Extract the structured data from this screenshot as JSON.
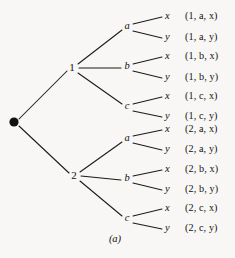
{
  "figure": {
    "caption": "(a)",
    "background_color": "#f8f7f5",
    "ink_color": "#111111",
    "type": "probability-tree-diagram"
  },
  "tree": {
    "root": {
      "name": "root-node",
      "label": "",
      "shape": "filled-dot",
      "x": 14,
      "y": 122
    },
    "level1": [
      {
        "name": "node-1",
        "label": "1",
        "x": 72,
        "y": 68
      },
      {
        "name": "node-2",
        "label": "2",
        "x": 74,
        "y": 176
      }
    ],
    "level2": [
      {
        "name": "node-1-a",
        "label": "a",
        "parent": "1",
        "x": 127,
        "y": 27
      },
      {
        "name": "node-1-b",
        "label": "b",
        "parent": "1",
        "x": 127,
        "y": 67
      },
      {
        "name": "node-1-c",
        "label": "c",
        "parent": "1",
        "x": 127,
        "y": 107
      },
      {
        "name": "node-2-a",
        "label": "a",
        "parent": "2",
        "x": 127,
        "y": 139
      },
      {
        "name": "node-2-b",
        "label": "b",
        "parent": "2",
        "x": 127,
        "y": 179
      },
      {
        "name": "node-2-c",
        "label": "c",
        "parent": "2",
        "x": 127,
        "y": 219
      }
    ],
    "leaves": [
      {
        "name": "leaf-1-a-x",
        "label": "x",
        "x": 166,
        "y": 17
      },
      {
        "name": "leaf-1-a-y",
        "label": "y",
        "x": 166,
        "y": 38
      },
      {
        "name": "leaf-1-b-x",
        "label": "x",
        "x": 166,
        "y": 58
      },
      {
        "name": "leaf-1-b-y",
        "label": "y",
        "x": 166,
        "y": 78
      },
      {
        "name": "leaf-1-c-x",
        "label": "x",
        "x": 166,
        "y": 97
      },
      {
        "name": "leaf-1-c-y",
        "label": "y",
        "x": 166,
        "y": 117
      },
      {
        "name": "leaf-2-a-x",
        "label": "x",
        "x": 166,
        "y": 131
      },
      {
        "name": "leaf-2-a-y",
        "label": "y",
        "x": 166,
        "y": 150
      },
      {
        "name": "leaf-2-b-x",
        "label": "x",
        "x": 166,
        "y": 170
      },
      {
        "name": "leaf-2-b-y",
        "label": "y",
        "x": 166,
        "y": 190
      },
      {
        "name": "leaf-2-c-x",
        "label": "x",
        "x": 166,
        "y": 209
      },
      {
        "name": "leaf-2-c-y",
        "label": "y",
        "x": 166,
        "y": 229
      }
    ],
    "outcomes": [
      {
        "name": "outcome-1-a-x",
        "text": "(1, a, x)",
        "first": "1",
        "second": "a",
        "third": "x",
        "y": 17
      },
      {
        "name": "outcome-1-a-y",
        "text": "(1, a, y)",
        "first": "1",
        "second": "a",
        "third": "y",
        "y": 38
      },
      {
        "name": "outcome-1-b-x",
        "text": "(1, b, x)",
        "first": "1",
        "second": "b",
        "third": "x",
        "y": 58
      },
      {
        "name": "outcome-1-b-y",
        "text": "(1, b, y)",
        "first": "1",
        "second": "b",
        "third": "y",
        "y": 78
      },
      {
        "name": "outcome-1-c-x",
        "text": "(1, c, x)",
        "first": "1",
        "second": "c",
        "third": "x",
        "y": 97
      },
      {
        "name": "outcome-1-c-y",
        "text": "(1, c, y)",
        "first": "1",
        "second": "c",
        "third": "y",
        "y": 117
      },
      {
        "name": "outcome-2-a-x",
        "text": "(2, a, x)",
        "first": "2",
        "second": "a",
        "third": "x",
        "y": 131
      },
      {
        "name": "outcome-2-a-y",
        "text": "(2, a, y)",
        "first": "2",
        "second": "a",
        "third": "y",
        "y": 150
      },
      {
        "name": "outcome-2-b-x",
        "text": "(2, b, x)",
        "first": "2",
        "second": "b",
        "third": "x",
        "y": 170
      },
      {
        "name": "outcome-2-b-y",
        "text": "(2, b, y)",
        "first": "2",
        "second": "b",
        "third": "y",
        "y": 190
      },
      {
        "name": "outcome-2-c-x",
        "text": "(2, c, x)",
        "first": "2",
        "second": "c",
        "third": "x",
        "y": 209
      },
      {
        "name": "outcome-2-c-y",
        "text": "(2, c, y)",
        "first": "2",
        "second": "c",
        "third": "y",
        "y": 229
      }
    ]
  }
}
